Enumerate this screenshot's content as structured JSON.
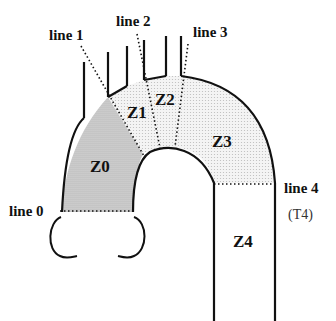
{
  "lines": [
    {
      "id": "line0",
      "label": "line 0"
    },
    {
      "id": "line1",
      "label": "line 1"
    },
    {
      "id": "line2",
      "label": "line 2"
    },
    {
      "id": "line3",
      "label": "line 3"
    },
    {
      "id": "line4",
      "label": "line 4",
      "sublabel": "(T4)"
    }
  ],
  "zones": [
    {
      "id": "Z0",
      "label": "Z0",
      "shade": "#cfcfcf"
    },
    {
      "id": "Z1",
      "label": "Z1",
      "shade": "#ececec"
    },
    {
      "id": "Z2",
      "label": "Z2",
      "shade": "#ececec"
    },
    {
      "id": "Z3",
      "label": "Z3",
      "shade": "#ececec"
    },
    {
      "id": "Z4",
      "label": "Z4",
      "shade": "#ffffff"
    }
  ]
}
